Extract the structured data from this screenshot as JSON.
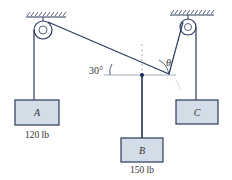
{
  "diagram": {
    "angles": {
      "left": "30°",
      "right": "θ"
    },
    "blocks": [
      {
        "id": "A",
        "label": "A",
        "weight": "120 lb"
      },
      {
        "id": "B",
        "label": "B",
        "weight": "150 lb"
      },
      {
        "id": "C",
        "label": "C",
        "weight": ""
      }
    ],
    "colors": {
      "block_fill": "#d3dde8",
      "block_stroke": "#2a3a5a",
      "rope": "#2a3a5a",
      "junction": "#1a2a5a"
    }
  }
}
